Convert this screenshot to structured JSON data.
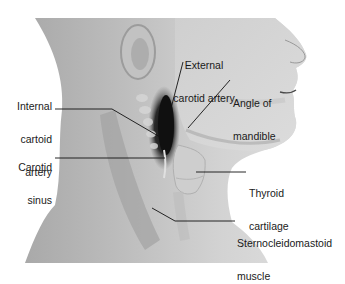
{
  "figure": {
    "type": "anatomical illustration",
    "labels": [
      {
        "id": "external-carotid-artery",
        "line1": "External",
        "line2": "carotid artery"
      },
      {
        "id": "angle-of-mandible",
        "line1": "Angle of",
        "line2": "mandible"
      },
      {
        "id": "internal-carotid-artery",
        "line1": "Internal",
        "line2": "cartoid",
        "line3": "artery"
      },
      {
        "id": "carotid-sinus",
        "line1": "Carotid",
        "line2": "sinus"
      },
      {
        "id": "thyroid-cartilage",
        "line1": "Thyroid",
        "line2": "cartilage"
      },
      {
        "id": "sternocleidomastoid-muscle",
        "line1": "Sternocleidomastoid",
        "line2": "muscle"
      }
    ]
  },
  "colors": {
    "background": "#ffffff",
    "skin_light": "#d9d9d9",
    "skin_mid": "#b8b8b8",
    "skin_dark": "#8e8e8e",
    "shadow": "#1c1c1c",
    "leader_line": "#111111",
    "text": "#1a1a1a"
  }
}
